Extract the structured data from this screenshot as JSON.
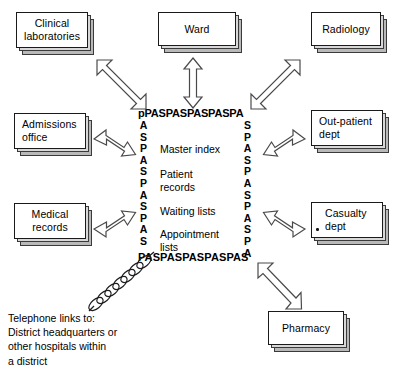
{
  "diagram": {
    "colors": {
      "ink": "#000000",
      "box_fill": "#ffffff",
      "box_border": "#1a1a1a",
      "stack_mid": "#d8d8d8",
      "stack_back": "#b9b9b9",
      "arrow_stroke": "#4a4a4a"
    }
  },
  "central_system": {
    "border_top_text": "pPASPASPASPASPA",
    "border_bottom_text": "PASPASPASPASPAS",
    "border_left_letters": [
      "A",
      "S",
      "P",
      "A",
      "S",
      "P",
      "A",
      "S",
      "P",
      "A",
      "S"
    ],
    "border_right_letters": [
      "S",
      "P",
      "A",
      "S",
      "P",
      "A",
      "S",
      "P",
      "A",
      "S",
      "P",
      "A"
    ],
    "functions": [
      "Master index",
      "Patient\nrecords",
      "Waiting lists",
      "Appointment\nlists"
    ]
  },
  "departments": [
    {
      "id": "clinical-laboratories",
      "label": "Clinical\nlaboratories"
    },
    {
      "id": "ward",
      "label": "Ward"
    },
    {
      "id": "radiology",
      "label": "Radiology"
    },
    {
      "id": "admissions-office",
      "label": "Admissions\noffice"
    },
    {
      "id": "out-patient-dept",
      "label": "Out-patient\ndept"
    },
    {
      "id": "medical-records",
      "label": "Medical\nrecords"
    },
    {
      "id": "casualty-dept",
      "label": "Casualty\ndept"
    },
    {
      "id": "pharmacy",
      "label": "Pharmacy"
    }
  ],
  "caption": {
    "text": "Telephone links to:\nDistrict headquarters or\nother hospitals within\na district"
  }
}
